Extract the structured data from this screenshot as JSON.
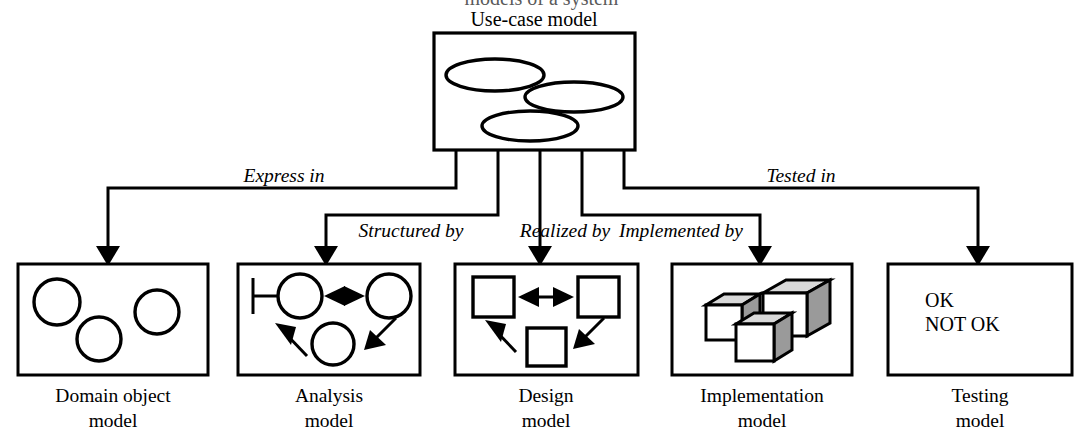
{
  "diagram": {
    "title": "Use-case model",
    "cropped_top_line": "models of a system",
    "source_node": {
      "label": "Use-case model",
      "shape": "rectangle",
      "contents": "three ellipses",
      "ellipse_count": 3
    },
    "edges": [
      {
        "id": "express-in",
        "label": "Express in",
        "from": "Use-case model",
        "to": "Domain object model"
      },
      {
        "id": "structured-by",
        "label": "Structured by",
        "from": "Use-case model",
        "to": "Analysis model"
      },
      {
        "id": "realized-by",
        "label": "Realized by",
        "from": "Use-case model",
        "to": "Design model"
      },
      {
        "id": "implemented-by",
        "label": "Implemented by",
        "from": "Use-case model",
        "to": "Implementation model"
      },
      {
        "id": "tested-in",
        "label": "Tested in",
        "from": "Use-case model",
        "to": "Testing model"
      }
    ],
    "targets": [
      {
        "id": "domain-object-model",
        "caption_line1": "Domain object",
        "caption_line2": "model",
        "glyph": "three-circles"
      },
      {
        "id": "analysis-model",
        "caption_line1": "Analysis",
        "caption_line2": "model",
        "glyph": "boundary-circles-with-arrows"
      },
      {
        "id": "design-model",
        "caption_line1": "Design",
        "caption_line2": "model",
        "glyph": "three-squares-with-arrows"
      },
      {
        "id": "implementation-model",
        "caption_line1": "Implementation",
        "caption_line2": "model",
        "glyph": "three-cubes"
      },
      {
        "id": "testing-model",
        "caption_line1": "Testing",
        "caption_line2": "model",
        "glyph": "verdict-text",
        "verdicts": [
          "OK",
          "NOT OK"
        ]
      }
    ],
    "colors": {
      "ink": "#000000",
      "paper": "#ffffff",
      "cube_top": "#d9d9d9",
      "cube_side": "#9a9a9a"
    }
  }
}
